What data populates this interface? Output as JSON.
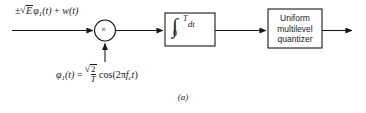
{
  "figure": {
    "caption": "(a)",
    "background_color": "#ffffff",
    "stroke_color": "#1a1a1a"
  },
  "input_signal": {
    "label_plain": "±√E φ₁(t) + w(t)",
    "pm_sign": "±",
    "energy_symbol": "E",
    "basis_symbol": "φ",
    "basis_subscript": "1",
    "basis_arg": "(t)",
    "plus": "+",
    "noise_symbol": "w",
    "noise_arg": "(t)"
  },
  "multiplier": {
    "name": "product-modulator",
    "glyph": "×"
  },
  "integrator": {
    "name": "integrator",
    "expression_plain": "∫₀ᵀ dt",
    "integral_glyph": "∫",
    "upper_limit": "T",
    "lower_limit": "0",
    "differential": "dt"
  },
  "quantizer": {
    "name": "uniform-multilevel-quantizer",
    "lines": [
      "Uniform",
      "multilevel",
      "quantizer"
    ]
  },
  "carrier": {
    "label_plain": "φ₁(t) = √(2/T) cos(2πfᴄt)",
    "basis_symbol": "φ",
    "basis_subscript": "1",
    "basis_arg": "(t)",
    "equals": "=",
    "frac_numerator": "2",
    "frac_denominator": "T",
    "cos_text": "cos(2",
    "pi": "π",
    "freq_symbol": "f",
    "freq_subscript": "c",
    "time_symbol": "t",
    "close_paren": ")"
  },
  "connections": [
    {
      "name": "input-to-multiplier",
      "type": "arrow"
    },
    {
      "name": "carrier-to-multiplier",
      "type": "arrow"
    },
    {
      "name": "multiplier-to-integrator",
      "type": "arrow"
    },
    {
      "name": "integrator-to-quantizer",
      "type": "arrow"
    },
    {
      "name": "quantizer-output",
      "type": "arrow"
    }
  ]
}
